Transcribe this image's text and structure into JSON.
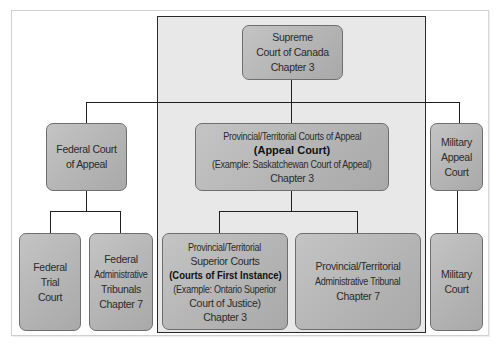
{
  "diagram": {
    "colors": {
      "box_fill": "#b8b8b8",
      "box_border": "#6e6e6e",
      "panel_fill": "#e8e8e8",
      "connector": "#1e1e1e",
      "text": "#2b2b2b"
    },
    "nodes": {
      "supreme": {
        "lines": [
          "Supreme",
          "Court of Canada",
          "Chapter 3"
        ]
      },
      "federal_appeal": {
        "lines": [
          "Federal Court",
          "of Appeal"
        ]
      },
      "provincial_appeal": {
        "lines": [
          "Provincial/Territorial Courts of Appeal",
          "(Appeal Court)",
          "(Example: Saskatchewan Court of Appeal)",
          "Chapter 3"
        ],
        "bold_line_index": 1
      },
      "military_appeal": {
        "lines": [
          "Military",
          "Appeal",
          "Court"
        ]
      },
      "federal_trial": {
        "lines": [
          "Federal",
          "Trial",
          "Court"
        ]
      },
      "federal_admin": {
        "lines": [
          "Federal",
          "Administrative",
          "Tribunals",
          "Chapter 7"
        ]
      },
      "provincial_superior": {
        "lines": [
          "Provincial/Territorial",
          "Superior Courts",
          "(Courts of First Instance)",
          "(Example: Ontario Superior",
          "Court of Justice)",
          "Chapter 3"
        ],
        "bold_line_index": 2
      },
      "provincial_admin": {
        "lines": [
          "Provincial/Territorial",
          "Administrative Tribunal",
          "Chapter 7"
        ]
      },
      "military_court": {
        "lines": [
          "Military",
          "Court"
        ]
      }
    },
    "edges": [
      [
        "supreme",
        "federal_appeal"
      ],
      [
        "supreme",
        "provincial_appeal"
      ],
      [
        "supreme",
        "military_appeal"
      ],
      [
        "federal_appeal",
        "federal_trial"
      ],
      [
        "federal_appeal",
        "federal_admin"
      ],
      [
        "provincial_appeal",
        "provincial_superior"
      ],
      [
        "provincial_appeal",
        "provincial_admin"
      ],
      [
        "military_appeal",
        "military_court"
      ]
    ]
  }
}
